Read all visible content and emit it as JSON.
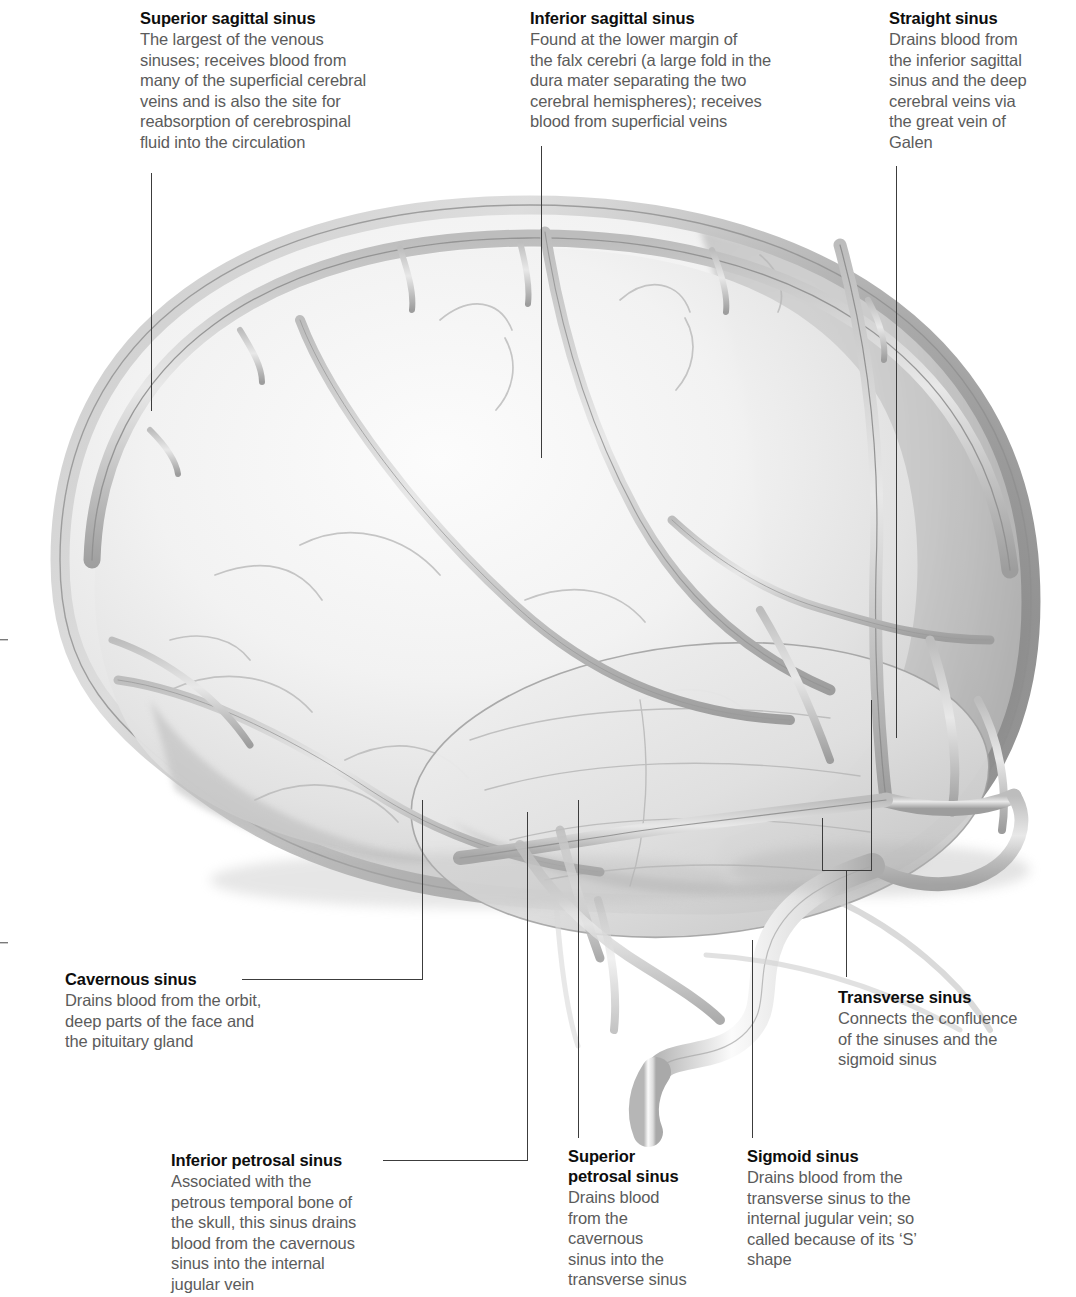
{
  "figure": {
    "style": "grayscale airbrush medical illustration",
    "colors": {
      "title_text": "#0d0d0d",
      "body_text": "#5b5b5b",
      "leader_line": "#3c3c3c",
      "background": "#ffffff",
      "brain_light": "#f3f3f3",
      "brain_mid": "#d9d9d9",
      "brain_shadow": "#a8a8a8",
      "sinus_dark": "#8a8a8a",
      "sinus_outline": "#6f6f6f"
    }
  },
  "labels": [
    {
      "id": "superior-sagittal-sinus",
      "title": "Superior sagittal sinus",
      "body": "The largest of the venous\nsinuses; receives blood from\nmany of the superficial cerebral\nveins and is also the site for\nreabsorption of cerebrospinal\nfluid into the circulation"
    },
    {
      "id": "inferior-sagittal-sinus",
      "title": "Inferior sagittal sinus",
      "body": "Found at the lower margin of\nthe falx cerebri (a large fold in the\ndura mater separating the two\ncerebral hemispheres); receives\nblood from superficial veins"
    },
    {
      "id": "straight-sinus",
      "title": "Straight sinus",
      "body": "Drains blood from\nthe inferior sagittal\nsinus and the deep\ncerebral veins via\nthe great vein of\nGalen"
    },
    {
      "id": "cavernous-sinus",
      "title": "Cavernous sinus",
      "body": "Drains blood from the orbit,\ndeep parts of the face and\nthe pituitary gland"
    },
    {
      "id": "transverse-sinus",
      "title": "Transverse sinus",
      "body": "Connects the confluence\nof the sinuses and the\nsigmoid sinus"
    },
    {
      "id": "inferior-petrosal-sinus",
      "title": "Inferior petrosal sinus",
      "body": "Associated with the\npetrous temporal bone of\nthe skull, this sinus drains\nblood from the cavernous\nsinus into the internal\njugular vein"
    },
    {
      "id": "superior-petrosal-sinus",
      "title": "Superior\npetrosal sinus",
      "body": "Drains blood\nfrom the\ncavernous\nsinus into the\ntransverse sinus"
    },
    {
      "id": "sigmoid-sinus",
      "title": "Sigmoid sinus",
      "body": "Drains blood from the\ntransverse sinus to the\ninternal jugular vein; so\ncalled because of its ‘S’\nshape"
    }
  ]
}
